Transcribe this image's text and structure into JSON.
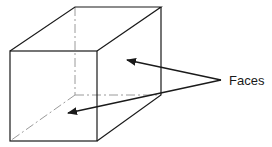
{
  "diagram": {
    "type": "isometric-cube",
    "colors": {
      "line": "#1a1a1a",
      "hidden": "#9a9a9a",
      "background": "#ffffff"
    },
    "labels": {
      "faces": "Faces"
    },
    "front_face": {
      "tl": [
        10,
        51
      ],
      "tr": [
        97,
        51
      ],
      "br": [
        97,
        141
      ],
      "bl": [
        10,
        141
      ]
    },
    "back_face": {
      "tl": [
        75,
        7
      ],
      "tr": [
        161,
        7
      ],
      "br": [
        161,
        95
      ],
      "bl": [
        75,
        95
      ]
    },
    "arrows": [
      {
        "from": [
          221,
          80
        ],
        "to": [
          127,
          60
        ],
        "target": "right-side-face"
      },
      {
        "from": [
          221,
          80
        ],
        "to": [
          68,
          113
        ],
        "target": "front-face"
      }
    ]
  }
}
